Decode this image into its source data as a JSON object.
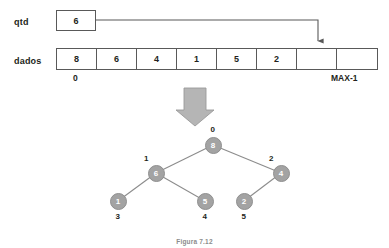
{
  "diagram": {
    "labels": {
      "qtd": "qtd",
      "dados": "dados"
    },
    "qtd_value": "6",
    "array": {
      "cells": [
        "8",
        "6",
        "4",
        "1",
        "5",
        "2",
        "",
        ""
      ],
      "index_start": "0",
      "index_end": "MAX-1",
      "pointer_cell_index": 6
    },
    "tree": {
      "nodes": [
        {
          "value": "8",
          "index": "0",
          "x": 213,
          "y": 145
        },
        {
          "value": "6",
          "index": "1",
          "x": 156,
          "y": 173
        },
        {
          "value": "4",
          "index": "2",
          "x": 281,
          "y": 173
        },
        {
          "value": "1",
          "index": "3",
          "x": 118,
          "y": 201
        },
        {
          "value": "5",
          "index": "4",
          "x": 205,
          "y": 201
        },
        {
          "value": "2",
          "index": "5",
          "x": 244,
          "y": 201
        }
      ],
      "edges": [
        {
          "from": 0,
          "to": 1
        },
        {
          "from": 0,
          "to": 2
        },
        {
          "from": 1,
          "to": 3
        },
        {
          "from": 1,
          "to": 4
        },
        {
          "from": 2,
          "to": 5
        }
      ]
    },
    "caption": "Figura 7.12",
    "colors": {
      "node_fill": "#a3a3a3",
      "node_text": "#ffffff",
      "line": "#8c8c8c",
      "border": "#595959",
      "block_arrow": "#b5b5b5",
      "text": "#231f20"
    }
  }
}
